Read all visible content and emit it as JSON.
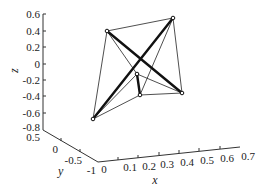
{
  "chart_data": {
    "type": "3d-line",
    "title": "",
    "xlabel": "x",
    "ylabel": "y",
    "zlabel": "z",
    "xlim": [
      0,
      0.7
    ],
    "ylim": [
      -1,
      0.5
    ],
    "zlim": [
      -0.8,
      0.6
    ],
    "x_ticks": [
      "0",
      "0.1",
      "0.2",
      "0.3",
      "0.4",
      "0.5",
      "0.6",
      "0.7"
    ],
    "y_ticks": [
      "0.5",
      "0",
      "-0.5",
      "-1"
    ],
    "z_ticks": [
      "0.6",
      "0.4",
      "0.2",
      "0",
      "-0.2",
      "-0.4",
      "-0.6",
      "-0.8"
    ],
    "grid": false,
    "nodes": [
      {
        "id": "A",
        "screen": [
          107,
          31
        ]
      },
      {
        "id": "B",
        "screen": [
          173,
          18
        ]
      },
      {
        "id": "C",
        "screen": [
          182,
          93
        ]
      },
      {
        "id": "D",
        "screen": [
          93,
          119
        ]
      },
      {
        "id": "E",
        "screen": [
          137,
          74
        ]
      },
      {
        "id": "F",
        "screen": [
          140,
          95
        ]
      }
    ],
    "edges": [
      {
        "from": "A",
        "to": "C",
        "weight": "thick"
      },
      {
        "from": "B",
        "to": "D",
        "weight": "thick"
      },
      {
        "from": "E",
        "to": "F",
        "weight": "thick"
      },
      {
        "from": "A",
        "to": "B",
        "weight": "thin"
      },
      {
        "from": "A",
        "to": "D",
        "weight": "thin"
      },
      {
        "from": "B",
        "to": "C",
        "weight": "thin"
      },
      {
        "from": "A",
        "to": "E",
        "weight": "thin"
      },
      {
        "from": "B",
        "to": "F",
        "weight": "thin"
      },
      {
        "from": "D",
        "to": "E",
        "weight": "thin"
      },
      {
        "from": "D",
        "to": "F",
        "weight": "thin"
      },
      {
        "from": "E",
        "to": "C",
        "weight": "thin"
      },
      {
        "from": "F",
        "to": "C",
        "weight": "thin"
      }
    ]
  }
}
